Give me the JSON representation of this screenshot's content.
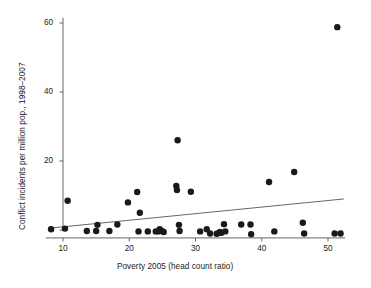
{
  "chart_data": {
    "type": "scatter",
    "title": "",
    "xlabel": "Poverty 2005 (head count ratio)",
    "ylabel": "Conflict incidents per million pop., 1998–2007",
    "xlim": [
      7.4,
      52.6
    ],
    "ylim": [
      -2.5,
      61.5
    ],
    "xticks": [
      10,
      20,
      30,
      40,
      50
    ],
    "xtick_labels": [
      "10",
      "20",
      "30",
      "40",
      "50"
    ],
    "yticks": [
      0,
      20,
      40,
      60
    ],
    "ytick_labels": [
      "0",
      "20",
      "40",
      "60"
    ],
    "grid": false,
    "legend": null,
    "marker_color": "#1a1a1a",
    "marker_size": 4.2,
    "axis_color": "#555555",
    "points": [
      {
        "x": 8.2,
        "y": 0.2
      },
      {
        "x": 10.3,
        "y": 0.4
      },
      {
        "x": 10.7,
        "y": 8.5
      },
      {
        "x": 13.6,
        "y": -0.3
      },
      {
        "x": 15.0,
        "y": -0.3
      },
      {
        "x": 15.2,
        "y": 1.5
      },
      {
        "x": 17.0,
        "y": -0.3
      },
      {
        "x": 18.2,
        "y": 1.6
      },
      {
        "x": 19.8,
        "y": 8.0
      },
      {
        "x": 21.2,
        "y": 11.0
      },
      {
        "x": 21.4,
        "y": -0.4
      },
      {
        "x": 21.6,
        "y": 5.0
      },
      {
        "x": 22.8,
        "y": -0.4
      },
      {
        "x": 24.0,
        "y": -0.4
      },
      {
        "x": 24.4,
        "y": -0.4
      },
      {
        "x": 24.6,
        "y": 0.2
      },
      {
        "x": 24.9,
        "y": -0.3
      },
      {
        "x": 25.2,
        "y": -0.6
      },
      {
        "x": 27.1,
        "y": 12.8
      },
      {
        "x": 27.2,
        "y": 11.6
      },
      {
        "x": 27.3,
        "y": 26.0
      },
      {
        "x": 27.5,
        "y": 1.5
      },
      {
        "x": 27.6,
        "y": -0.3
      },
      {
        "x": 29.3,
        "y": 11.1
      },
      {
        "x": 30.7,
        "y": -0.4
      },
      {
        "x": 31.7,
        "y": 0.2
      },
      {
        "x": 32.2,
        "y": -1.0
      },
      {
        "x": 33.2,
        "y": -1.1
      },
      {
        "x": 33.5,
        "y": -0.9
      },
      {
        "x": 33.7,
        "y": -0.6
      },
      {
        "x": 33.9,
        "y": -0.8
      },
      {
        "x": 34.3,
        "y": 1.7
      },
      {
        "x": 34.5,
        "y": -0.4
      },
      {
        "x": 36.9,
        "y": 1.6
      },
      {
        "x": 38.3,
        "y": 1.6
      },
      {
        "x": 38.4,
        "y": -1.2
      },
      {
        "x": 41.1,
        "y": 13.9
      },
      {
        "x": 41.9,
        "y": -0.4
      },
      {
        "x": 44.9,
        "y": 16.8
      },
      {
        "x": 46.2,
        "y": 2.1
      },
      {
        "x": 46.4,
        "y": -1.0
      },
      {
        "x": 51.0,
        "y": -1.0
      },
      {
        "x": 51.4,
        "y": 58.8
      },
      {
        "x": 51.9,
        "y": -1.0
      }
    ],
    "fit_line": {
      "x_start": 8.3,
      "y_start": 0.6,
      "x_end": 52.4,
      "y_end": 9.0
    }
  }
}
